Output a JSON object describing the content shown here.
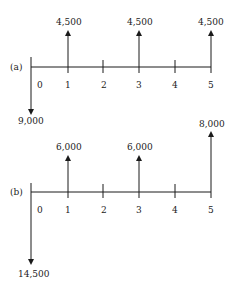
{
  "diagram": {
    "type": "cash-flow-diagrams",
    "colors": {
      "line": "#1a1a1a",
      "text": "#222222",
      "background": "#ffffff"
    },
    "periods": [
      "0",
      "1",
      "2",
      "3",
      "4",
      "5"
    ],
    "a": {
      "label": "(a)",
      "flows": [
        {
          "period": "0",
          "direction": "down",
          "amount": "9,000"
        },
        {
          "period": "1",
          "direction": "up",
          "amount": "4,500"
        },
        {
          "period": "3",
          "direction": "up",
          "amount": "4,500"
        },
        {
          "period": "5",
          "direction": "up",
          "amount": "4,500"
        }
      ]
    },
    "b": {
      "label": "(b)",
      "flows": [
        {
          "period": "0",
          "direction": "down",
          "amount": "14,500"
        },
        {
          "period": "1",
          "direction": "up",
          "amount": "6,000"
        },
        {
          "period": "3",
          "direction": "up",
          "amount": "6,000"
        },
        {
          "period": "5",
          "direction": "up",
          "amount": "8,000"
        }
      ]
    }
  }
}
